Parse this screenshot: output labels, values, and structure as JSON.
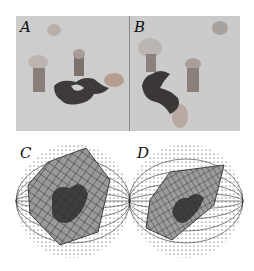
{
  "figure": {
    "panels": [
      {
        "id": "A",
        "label": "A",
        "kind": "photograph",
        "description": "Rendered scene of a dark 3-D puzzle-piece object with cylinders and blob shapes on grey background"
      },
      {
        "id": "B",
        "label": "B",
        "kind": "photograph",
        "description": "Same scene viewed from a different angle"
      },
      {
        "id": "C",
        "label": "C",
        "kind": "spherical-mapping",
        "description": "Image patch mapped onto a sphere with meridian lines and dotted grid"
      },
      {
        "id": "D",
        "label": "D",
        "kind": "spherical-mapping",
        "description": "Second image patch mapped onto a sphere, rotated view"
      }
    ],
    "colors": {
      "background": "#ffffff",
      "photo_bg": "#cfcfcf",
      "object_dark": "#3a3a3a",
      "grid": "#222222"
    }
  }
}
